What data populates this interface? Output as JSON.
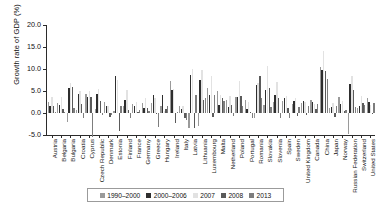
{
  "chart_data": {
    "type": "bar",
    "title": "",
    "xlabel": "",
    "ylabel": "Growth rate of GDP (%)",
    "ylim": [
      -5.0,
      20.0
    ],
    "yticks": [
      -5.0,
      0.0,
      5.0,
      10.0,
      15.0,
      20.0
    ],
    "ytick_labels": [
      "-5.0",
      "0.0",
      "5.0",
      "10.0",
      "15.0",
      "20.0"
    ],
    "grid": false,
    "legend_position": "bottom",
    "categories": [
      "Austria",
      "Belgaria",
      "Bulgaria",
      "Croatia",
      "Cyprus",
      "Czech Republic",
      "Denmark",
      "Estonia",
      "Finland",
      "France",
      "Germany",
      "Greece",
      "Hungary",
      "Ireland",
      "Italy",
      "Latvia",
      "Lithuania",
      "Luxembourg",
      "Malta",
      "Netherland",
      "Poland",
      "Portugal",
      "Romania",
      "Slovakia",
      "Slovenia",
      "Spain",
      "Sweden",
      "United Kingdom",
      "Canada",
      "China",
      "Japan",
      "Norway",
      "Russian Federation",
      "Switzerland",
      "United States"
    ],
    "series": [
      {
        "name": "1990–2000",
        "color": "#9a9a9a",
        "values": [
          2.6,
          2.3,
          -2.0,
          0.7,
          4.3,
          1.0,
          2.6,
          0.5,
          1.7,
          2.0,
          2.2,
          2.2,
          1.5,
          7.2,
          1.6,
          -3.5,
          -3.0,
          5.7,
          4.9,
          3.0,
          3.7,
          2.9,
          -1.2,
          1.9,
          2.6,
          2.7,
          2.0,
          2.3,
          2.9,
          10.4,
          1.2,
          3.7,
          -4.7,
          1.2,
          3.4
        ]
      },
      {
        "name": "2000–2006",
        "color": "#2e2e2e",
        "values": [
          1.7,
          1.9,
          5.6,
          4.3,
          3.7,
          4.3,
          1.5,
          8.4,
          3.0,
          1.7,
          1.1,
          4.1,
          4.0,
          5.3,
          1.0,
          8.6,
          7.5,
          4.0,
          1.8,
          1.4,
          3.6,
          1.0,
          6.3,
          5.2,
          4.1,
          3.4,
          2.7,
          2.7,
          2.6,
          9.8,
          1.4,
          2.1,
          6.5,
          1.5,
          2.5
        ]
      },
      {
        "name": "2007",
        "color": "#e2e2e2",
        "values": [
          3.7,
          3.6,
          6.9,
          5.1,
          5.1,
          5.5,
          1.6,
          7.5,
          5.3,
          2.4,
          3.3,
          3.5,
          0.4,
          5.5,
          1.5,
          10.0,
          9.8,
          8.4,
          4.0,
          3.9,
          7.2,
          2.5,
          6.9,
          10.7,
          7.0,
          3.8,
          3.4,
          2.6,
          2.0,
          14.2,
          2.2,
          2.7,
          8.5,
          3.8,
          1.8
        ]
      },
      {
        "name": "2008",
        "color": "#5a5a5a",
        "values": [
          1.5,
          0.8,
          5.8,
          2.1,
          3.6,
          2.7,
          -0.8,
          -4.2,
          0.7,
          0.2,
          1.1,
          -0.3,
          0.9,
          -2.2,
          -1.1,
          -3.3,
          2.9,
          -0.8,
          3.3,
          1.8,
          3.9,
          0.2,
          8.5,
          5.6,
          3.4,
          1.1,
          -0.6,
          -0.5,
          1.0,
          9.6,
          -1.0,
          0.4,
          5.2,
          2.2,
          -0.3
        ]
      },
      {
        "name": "2013",
        "color": "#7d7d7d",
        "values": [
          0.3,
          0.3,
          1.1,
          -1.1,
          -5.4,
          -0.5,
          -0.5,
          1.6,
          -1.2,
          0.7,
          0.4,
          -3.2,
          1.5,
          0.2,
          -1.7,
          4.2,
          3.5,
          4.2,
          2.7,
          -0.7,
          1.7,
          -1.1,
          3.5,
          1.4,
          -1.1,
          -1.2,
          1.3,
          1.7,
          2.0,
          7.7,
          1.6,
          0.7,
          1.3,
          1.9,
          2.2
        ]
      }
    ]
  },
  "legend": {
    "items": [
      {
        "label": "1990–2000"
      },
      {
        "label": "2000–2006"
      },
      {
        "label": "2007"
      },
      {
        "label": "2008"
      },
      {
        "label": "2013"
      }
    ]
  }
}
